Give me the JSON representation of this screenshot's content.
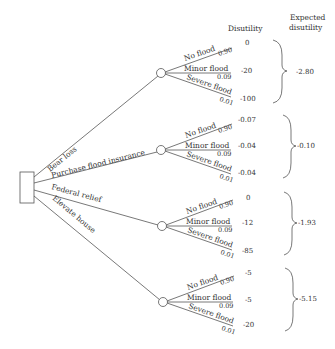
{
  "headers": {
    "disutility": "Disutility",
    "expected_line1": "Expected",
    "expected_line2": "disutility"
  },
  "decision_node": {
    "label": ""
  },
  "alternatives": [
    {
      "label": "Bear loss",
      "outcomes": [
        {
          "label": "No flood",
          "prob": "0.90",
          "disutility": "0"
        },
        {
          "label": "Minor flood",
          "prob": "0.09",
          "disutility": "-20"
        },
        {
          "label": "Severe flood",
          "prob": "0.01",
          "disutility": "-100"
        }
      ],
      "expected": "-2.80"
    },
    {
      "label": "Purchase flood insurance",
      "outcomes": [
        {
          "label": "No flood",
          "prob": "0.90",
          "disutility": "-0.07"
        },
        {
          "label": "Minor flood",
          "prob": "0.09",
          "disutility": "-0.04"
        },
        {
          "label": "Severe flood",
          "prob": "0.01",
          "disutility": "-0.04"
        }
      ],
      "expected": "-0.10"
    },
    {
      "label": "Federal relief",
      "outcomes": [
        {
          "label": "No flood",
          "prob": "0.90",
          "disutility": "0"
        },
        {
          "label": "Minor flood",
          "prob": "0.09",
          "disutility": "-12"
        },
        {
          "label": "Severe flood",
          "prob": "0.01",
          "disutility": "-85"
        }
      ],
      "expected": "-1.93"
    },
    {
      "label": "Elevate house",
      "outcomes": [
        {
          "label": "No flood",
          "prob": "0.90",
          "disutility": "-5"
        },
        {
          "label": "Minor flood",
          "prob": "0.09",
          "disutility": "-5"
        },
        {
          "label": "Severe flood",
          "prob": "0.01",
          "disutility": "-20"
        }
      ],
      "expected": "-5.15"
    }
  ]
}
